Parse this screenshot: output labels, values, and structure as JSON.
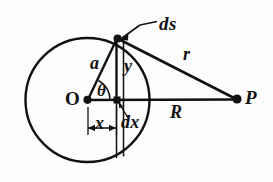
{
  "figure": {
    "kind": "geometry-diagram",
    "stroke_color": "#111111",
    "background_color": "#fdfdfd"
  },
  "labels": {
    "ds": "ds",
    "r": "r",
    "R": "R",
    "a": "a",
    "y": "y",
    "theta": "θ",
    "x": "x",
    "dx": "dx",
    "O": "O",
    "P": "P"
  },
  "geometry": {
    "circle": {
      "cx": 87.5,
      "cy": 100,
      "r": 62
    },
    "points": {
      "O": {
        "x": 87.5,
        "y": 100
      },
      "P": {
        "x": 237,
        "y": 99
      },
      "S": {
        "x": 117,
        "y": 38
      },
      "foot": {
        "x": 117,
        "y": 100
      }
    },
    "strip": {
      "x_left": 116,
      "x_right": 123.5,
      "top": 36,
      "bottom": 159
    },
    "dimension_x": {
      "from": 87.5,
      "to": 116,
      "y": 128
    },
    "leader_ds": {
      "from": {
        "x": 157,
        "y": 22
      },
      "to": {
        "x": 120,
        "y": 40
      }
    }
  }
}
